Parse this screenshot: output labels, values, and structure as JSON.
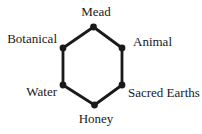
{
  "diagram": {
    "nodes": [
      {
        "label": "Mead",
        "position": "top"
      },
      {
        "label": "Animal",
        "position": "upper-right"
      },
      {
        "label": "Sacred Earths",
        "position": "lower-right"
      },
      {
        "label": "Honey",
        "position": "bottom"
      },
      {
        "label": "Water",
        "position": "lower-left"
      },
      {
        "label": "Botanical",
        "position": "upper-left"
      }
    ],
    "colors": {
      "edge": "#1a1a1a",
      "vertex_dot": "#1a1a1a",
      "text": "#1a1a1a",
      "background": "#ffffff"
    }
  }
}
